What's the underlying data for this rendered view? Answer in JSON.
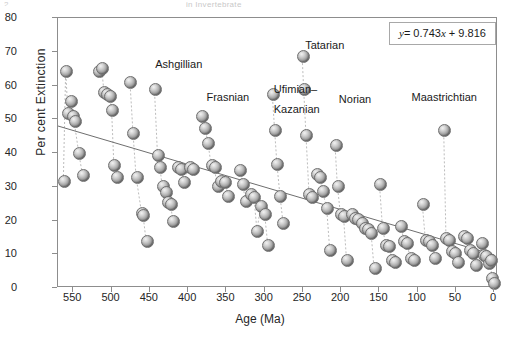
{
  "figure": {
    "top_cropped_text": "in Invertebrate",
    "corner_mark": "2.",
    "equation": "y = 0.743x + 9.816",
    "equation_parts": {
      "lhs": "y",
      "eq": "= 0.743",
      "xsym": "x",
      "rhs": "+ 9.816"
    }
  },
  "chart_data": {
    "type": "scatter",
    "title": "",
    "xlabel": "Age (Ma)",
    "ylabel": "Per cent Extinction",
    "xlim": [
      570,
      -5
    ],
    "ylim": [
      0,
      80
    ],
    "xticks": [
      550,
      500,
      450,
      400,
      350,
      300,
      250,
      200,
      150,
      100,
      50,
      0
    ],
    "yticks": [
      0,
      10,
      20,
      30,
      40,
      50,
      60,
      70,
      80
    ],
    "grid": false,
    "legend": null,
    "axis_reversed_x": true,
    "marker": {
      "style": "3d-sphere",
      "color": "#9a9a9a",
      "size": 11
    },
    "trendline": {
      "slope": 0.743,
      "intercept": 9.816,
      "equation": "y = 0.743x + 9.816",
      "note": "x measured in units of 100 Ma for display fit",
      "x_start": 570,
      "y_start": 48.0,
      "x_end": 0,
      "y_end": 9.8,
      "color": "#6e6e6e"
    },
    "annotations": [
      {
        "label": "Ashgillian",
        "x": 443,
        "y": 66.5
      },
      {
        "label": "Frasnian",
        "x": 376,
        "y": 56.5
      },
      {
        "label": "Ufimian–",
        "x": 288,
        "y": 59.0
      },
      {
        "label": "Kazanian",
        "x": 288,
        "y": 53.0
      },
      {
        "label": "Tatarian",
        "x": 247,
        "y": 72.0
      },
      {
        "label": "Norian",
        "x": 203,
        "y": 56.0
      },
      {
        "label": "Maastrichtian",
        "x": 108,
        "y": 56.5
      }
    ],
    "points": [
      {
        "x": 563,
        "y": 32.0
      },
      {
        "x": 560,
        "y": 64.3
      },
      {
        "x": 557,
        "y": 52.0
      },
      {
        "x": 554,
        "y": 55.5
      },
      {
        "x": 551,
        "y": 51.0
      },
      {
        "x": 549,
        "y": 49.5
      },
      {
        "x": 543,
        "y": 40.2
      },
      {
        "x": 538,
        "y": 33.5
      },
      {
        "x": 517,
        "y": 64.5
      },
      {
        "x": 513,
        "y": 65.3
      },
      {
        "x": 510,
        "y": 58.2
      },
      {
        "x": 506,
        "y": 57.5
      },
      {
        "x": 503,
        "y": 57.0
      },
      {
        "x": 500,
        "y": 53.0
      },
      {
        "x": 497,
        "y": 36.5
      },
      {
        "x": 493,
        "y": 33.0
      },
      {
        "x": 476,
        "y": 61.2
      },
      {
        "x": 472,
        "y": 46.0
      },
      {
        "x": 468,
        "y": 33.0
      },
      {
        "x": 461,
        "y": 22.5
      },
      {
        "x": 459,
        "y": 21.8
      },
      {
        "x": 455,
        "y": 14.2
      },
      {
        "x": 444,
        "y": 59.0
      },
      {
        "x": 440,
        "y": 39.5
      },
      {
        "x": 437,
        "y": 36.0
      },
      {
        "x": 434,
        "y": 30.5
      },
      {
        "x": 430,
        "y": 28.5
      },
      {
        "x": 427,
        "y": 25.5
      },
      {
        "x": 423,
        "y": 25.0
      },
      {
        "x": 420,
        "y": 20.0
      },
      {
        "x": 414,
        "y": 36.0
      },
      {
        "x": 410,
        "y": 35.5
      },
      {
        "x": 406,
        "y": 31.5
      },
      {
        "x": 398,
        "y": 36.0
      },
      {
        "x": 394,
        "y": 35.5
      },
      {
        "x": 383,
        "y": 51.0
      },
      {
        "x": 378,
        "y": 47.5
      },
      {
        "x": 374,
        "y": 43.0
      },
      {
        "x": 370,
        "y": 36.5
      },
      {
        "x": 366,
        "y": 36.0
      },
      {
        "x": 362,
        "y": 30.5
      },
      {
        "x": 357,
        "y": 32.0
      },
      {
        "x": 352,
        "y": 31.5
      },
      {
        "x": 348,
        "y": 27.5
      },
      {
        "x": 333,
        "y": 35.0
      },
      {
        "x": 329,
        "y": 31.0
      },
      {
        "x": 325,
        "y": 26.0
      },
      {
        "x": 318,
        "y": 28.0
      },
      {
        "x": 314,
        "y": 27.0
      },
      {
        "x": 310,
        "y": 17.0
      },
      {
        "x": 305,
        "y": 24.5
      },
      {
        "x": 300,
        "y": 22.0
      },
      {
        "x": 296,
        "y": 13.0
      },
      {
        "x": 290,
        "y": 57.5
      },
      {
        "x": 287,
        "y": 47.0
      },
      {
        "x": 284,
        "y": 37.0
      },
      {
        "x": 280,
        "y": 27.5
      },
      {
        "x": 276,
        "y": 19.5
      },
      {
        "x": 251,
        "y": 69.0
      },
      {
        "x": 249,
        "y": 59.0
      },
      {
        "x": 246,
        "y": 45.5
      },
      {
        "x": 242,
        "y": 28.0
      },
      {
        "x": 239,
        "y": 27.0
      },
      {
        "x": 232,
        "y": 34.0
      },
      {
        "x": 228,
        "y": 33.0
      },
      {
        "x": 225,
        "y": 29.0
      },
      {
        "x": 219,
        "y": 24.0
      },
      {
        "x": 215,
        "y": 11.5
      },
      {
        "x": 208,
        "y": 42.5
      },
      {
        "x": 205,
        "y": 30.5
      },
      {
        "x": 201,
        "y": 22.0
      },
      {
        "x": 197,
        "y": 21.5
      },
      {
        "x": 193,
        "y": 8.5
      },
      {
        "x": 186,
        "y": 22.0
      },
      {
        "x": 182,
        "y": 21.0
      },
      {
        "x": 178,
        "y": 20.5
      },
      {
        "x": 174,
        "y": 19.5
      },
      {
        "x": 170,
        "y": 18.0
      },
      {
        "x": 166,
        "y": 17.5
      },
      {
        "x": 161,
        "y": 16.5
      },
      {
        "x": 157,
        "y": 6.0
      },
      {
        "x": 150,
        "y": 31.0
      },
      {
        "x": 146,
        "y": 18.0
      },
      {
        "x": 142,
        "y": 13.0
      },
      {
        "x": 138,
        "y": 12.5
      },
      {
        "x": 134,
        "y": 8.5
      },
      {
        "x": 130,
        "y": 8.0
      },
      {
        "x": 122,
        "y": 18.5
      },
      {
        "x": 118,
        "y": 14.0
      },
      {
        "x": 114,
        "y": 13.5
      },
      {
        "x": 110,
        "y": 9.0
      },
      {
        "x": 106,
        "y": 8.5
      },
      {
        "x": 94,
        "y": 25.0
      },
      {
        "x": 90,
        "y": 14.5
      },
      {
        "x": 86,
        "y": 14.0
      },
      {
        "x": 82,
        "y": 13.0
      },
      {
        "x": 78,
        "y": 9.0
      },
      {
        "x": 66,
        "y": 47.0
      },
      {
        "x": 63,
        "y": 15.0
      },
      {
        "x": 60,
        "y": 14.5
      },
      {
        "x": 56,
        "y": 11.0
      },
      {
        "x": 52,
        "y": 10.5
      },
      {
        "x": 48,
        "y": 8.0
      },
      {
        "x": 40,
        "y": 15.5
      },
      {
        "x": 36,
        "y": 15.0
      },
      {
        "x": 32,
        "y": 11.5
      },
      {
        "x": 28,
        "y": 10.5
      },
      {
        "x": 24,
        "y": 7.0
      },
      {
        "x": 17,
        "y": 13.5
      },
      {
        "x": 14,
        "y": 10.0
      },
      {
        "x": 11,
        "y": 9.5
      },
      {
        "x": 8,
        "y": 7.5
      },
      {
        "x": 5,
        "y": 8.5
      },
      {
        "x": 3,
        "y": 3.0
      },
      {
        "x": 1,
        "y": 1.5
      }
    ],
    "connector_groups": [
      [
        563,
        560,
        557,
        554,
        551,
        549,
        543,
        538
      ],
      [
        517,
        513,
        510,
        506,
        503,
        500,
        497,
        493
      ],
      [
        476,
        472,
        468,
        461,
        459,
        455
      ],
      [
        444,
        440,
        437,
        434,
        430,
        427,
        423,
        420
      ],
      [
        414,
        410,
        406,
        398,
        394
      ],
      [
        383,
        378,
        374,
        370,
        366,
        362,
        357,
        352,
        348
      ],
      [
        333,
        329,
        325,
        318,
        314,
        310,
        305,
        300,
        296
      ],
      [
        290,
        287,
        284,
        280,
        276
      ],
      [
        251,
        249,
        246,
        242,
        239
      ],
      [
        232,
        228,
        225,
        219,
        215
      ],
      [
        208,
        205,
        201,
        197,
        193
      ],
      [
        186,
        182,
        178,
        174,
        170,
        166,
        161,
        157
      ],
      [
        150,
        146,
        142,
        138,
        134,
        130
      ],
      [
        122,
        118,
        114,
        110,
        106
      ],
      [
        94,
        90,
        86,
        82,
        78
      ],
      [
        66,
        63,
        60,
        56,
        52,
        48
      ],
      [
        40,
        36,
        32,
        28,
        24
      ],
      [
        17,
        14,
        11,
        8,
        5,
        3,
        1
      ]
    ]
  }
}
